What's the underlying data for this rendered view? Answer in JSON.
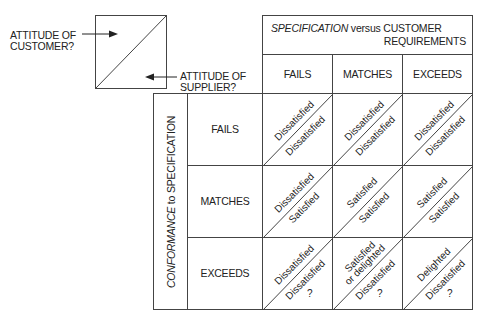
{
  "legend": {
    "customer_label_line1": "ATTITUDE OF",
    "customer_label_line2": "CUSTOMER?",
    "supplier_label_line1": "ATTITUDE OF",
    "supplier_label_line2": "SUPPLIER?"
  },
  "header": {
    "spec_italic": "SPECIFICATION",
    "spec_rest_line1": " versus CUSTOMER",
    "spec_line2": "REQUIREMENTS",
    "columns": [
      "FAILS",
      "MATCHES",
      "EXCEEDS"
    ]
  },
  "side": {
    "conformance_italic": "CONFORMANCE",
    "conformance_rest": " to SPECIFICATION",
    "rows": [
      "FAILS",
      "MATCHES",
      "EXCEEDS"
    ]
  },
  "cells": [
    [
      {
        "customer": "Dissatisfied",
        "supplier": "Dissatisfied"
      },
      {
        "customer": "Dissatisfied",
        "supplier": "Dissatisfied"
      },
      {
        "customer": "Dissatisfied",
        "supplier": "Dissatisfied"
      }
    ],
    [
      {
        "customer": "Dissatisfied",
        "supplier": "Satisfied"
      },
      {
        "customer": "Satisfied",
        "supplier": "Satisfied"
      },
      {
        "customer": "Satisfied",
        "supplier": "Satisfied"
      }
    ],
    [
      {
        "customer": "Dissatisfied",
        "supplier": "Dissatisfied",
        "supplier_extra": "?"
      },
      {
        "customer": "Satisfied",
        "customer_line2": "or delighted",
        "supplier": "Dissatisfied",
        "supplier_extra": "?"
      },
      {
        "customer": "Delighted",
        "supplier": "Dissatisfied",
        "supplier_extra": "?"
      }
    ]
  ]
}
